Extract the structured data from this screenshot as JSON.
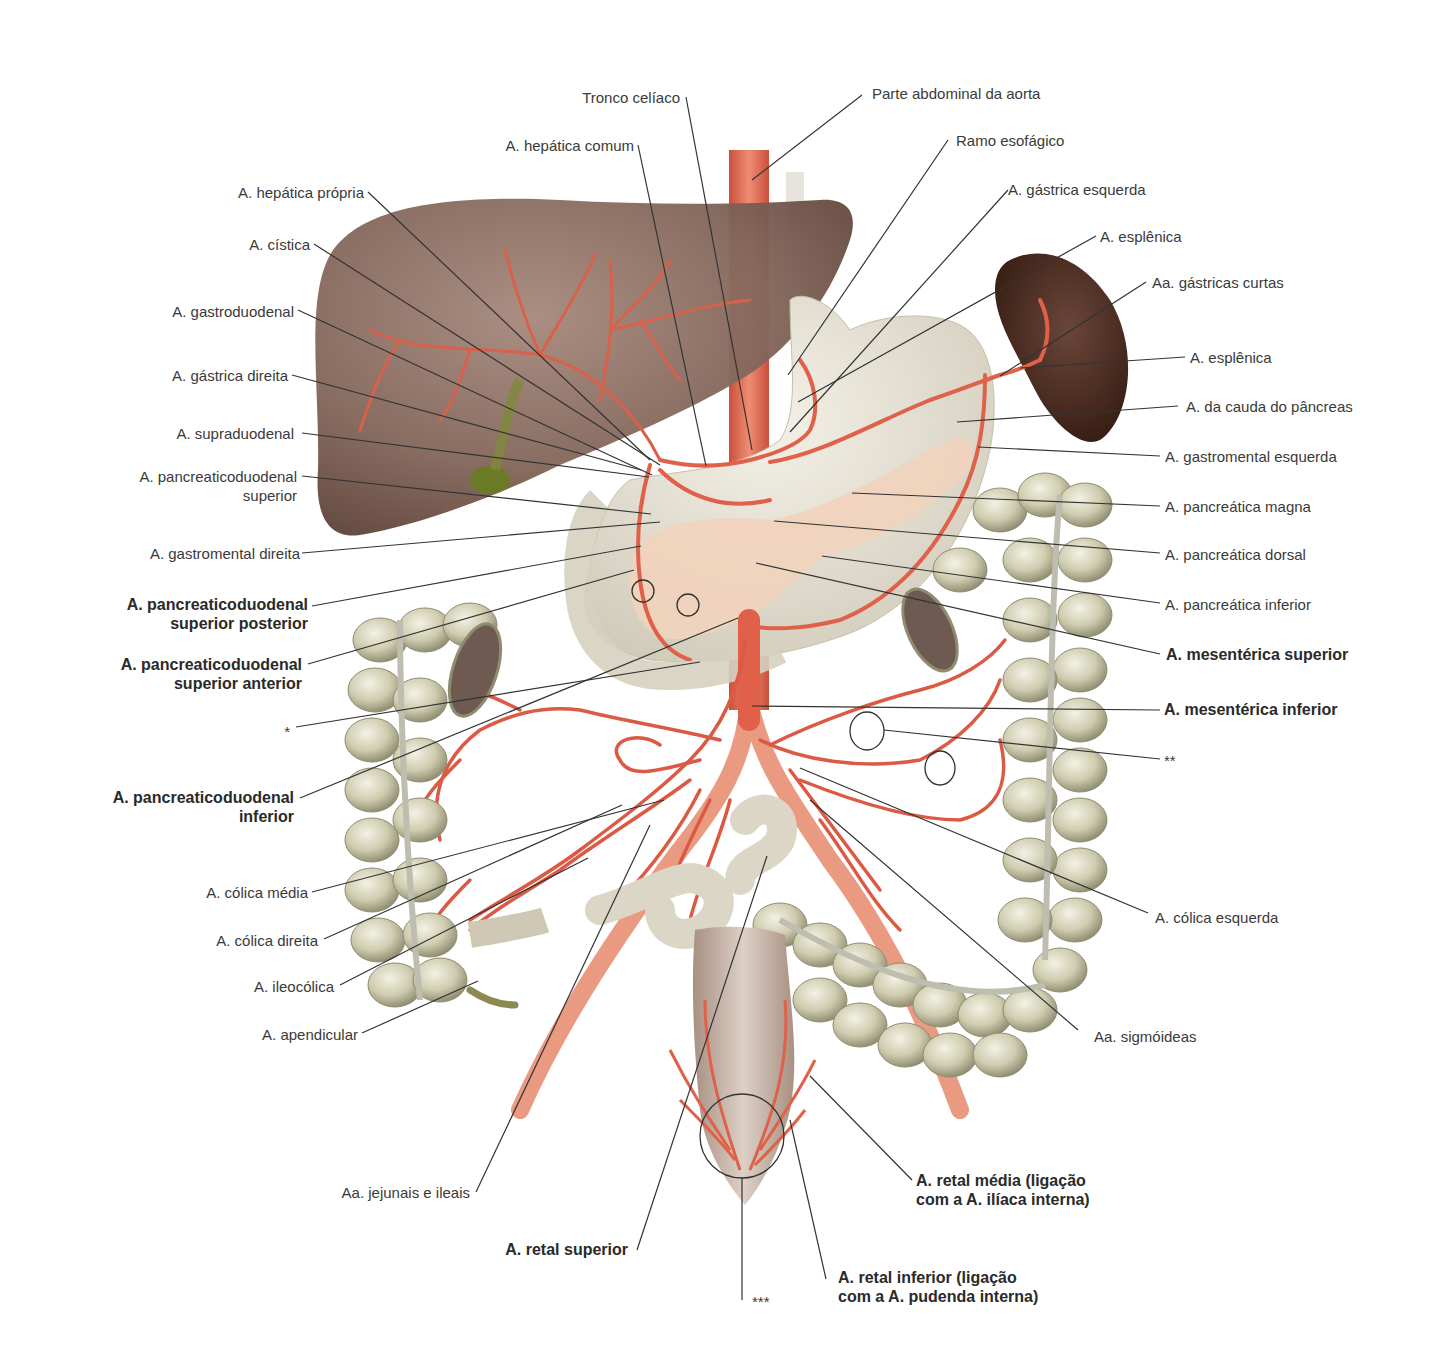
{
  "colors": {
    "liver": "#7a5a4e",
    "liver_highlight": "#9a7c70",
    "spleen": "#4a2c22",
    "artery": "#e0604a",
    "aorta": "#e06a50",
    "stomach": "#e6e2d6",
    "pancreas": "#f1d3bd",
    "colon": "#c9c6aa",
    "colon_shadow": "#8d8b6c",
    "gallbladder": "#6f7a2c",
    "rectum": "#c8b4a6",
    "leader": "#333333"
  },
  "labels": {
    "tronco_celiaco": "Tronco celíaco",
    "parte_abdominal_aorta": "Parte abdominal da aorta",
    "hepatica_comum": "A. hepática comum",
    "ramo_esofagico": "Ramo esofágico",
    "hepatica_propria": "A. hepática própria",
    "gastrica_esquerda": "A. gástrica esquerda",
    "cistica": "A. cística",
    "esplenica_1": "A. esplênica",
    "gastricas_curtas": "Aa. gástricas curtas",
    "gastroduodenal": "A. gastroduodenal",
    "esplenica_2": "A. esplênica",
    "gastrica_direita": "A. gástrica direita",
    "cauda_pancreas": "A. da cauda do pâncreas",
    "supraduodenal": "A. supraduodenal",
    "gastromental_esquerda": "A. gastromental esquerda",
    "pancreaticoduodenal_superior_l1": "A. pancreaticoduodenal",
    "pancreaticoduodenal_superior_l2": "superior",
    "pancreatica_magna": "A. pancreática magna",
    "gastromental_direita": "A. gastromental direita",
    "pancreatica_dorsal": "A. pancreática dorsal",
    "pd_sup_post_l1": "A. pancreaticoduodenal",
    "pd_sup_post_l2": "superior posterior",
    "pancreatica_inferior": "A. pancreática inferior",
    "pd_sup_ant_l1": "A. pancreaticoduodenal",
    "pd_sup_ant_l2": "superior anterior",
    "mesenterica_superior": "A. mesentérica superior",
    "asterisk_1": "*",
    "mesenterica_inferior": "A. mesentérica inferior",
    "asterisk_2": "**",
    "pd_inf_l1": "A. pancreaticoduodenal",
    "pd_inf_l2": "inferior",
    "colica_media": "A. cólica média",
    "colica_esquerda": "A. cólica esquerda",
    "colica_direita": "A. cólica direita",
    "ileocolica": "A. ileocólica",
    "sigmoideas": "Aa. sigmóideas",
    "apendicular": "A. apendicular",
    "jejunais_ileais": "Aa. jejunais e ileais",
    "retal_media_l1": "A. retal média (ligação",
    "retal_media_l2": "com a A. ilíaca interna)",
    "retal_superior": "A. retal superior",
    "asterisk_3": "***",
    "retal_inferior_l1": "A. retal inferior (ligação",
    "retal_inferior_l2": "com a A. pudenda interna)"
  }
}
